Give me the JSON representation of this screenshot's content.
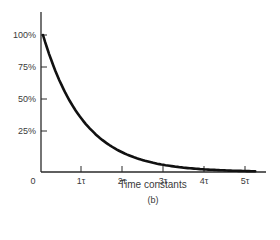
{
  "chart_data": {
    "type": "line",
    "title": "",
    "caption": "(b)",
    "xlabel": "Time constants",
    "ylabel": "",
    "x_tick_labels": [
      "0",
      "1τ",
      "2τ",
      "3τ",
      "4τ",
      "5τ"
    ],
    "y_tick_labels": [
      "25%",
      "50%",
      "75%",
      "100%"
    ],
    "xlim": [
      0,
      5.5
    ],
    "ylim": [
      0,
      100
    ],
    "grid": false,
    "legend": null,
    "series": [
      {
        "name": "Exponential decay",
        "x": [
          0,
          0.25,
          0.5,
          0.75,
          1,
          1.5,
          2,
          2.5,
          3,
          3.5,
          4,
          4.5,
          5
        ],
        "values": [
          100,
          77.9,
          60.7,
          47.2,
          36.8,
          22.3,
          13.5,
          8.2,
          5.0,
          3.0,
          1.8,
          1.1,
          0.7
        ]
      }
    ]
  },
  "labels": {
    "y": [
      {
        "text": "100%",
        "top": 30
      },
      {
        "text": "75%",
        "top": 62
      },
      {
        "text": "50%",
        "top": 94
      },
      {
        "text": "25%",
        "top": 126
      }
    ],
    "x": [
      {
        "text": "0",
        "left": 33
      },
      {
        "text": "1τ",
        "left": 81
      },
      {
        "text": "2τ",
        "left": 122
      },
      {
        "text": "3τ",
        "left": 163
      },
      {
        "text": "4τ",
        "left": 204
      },
      {
        "text": "5τ",
        "left": 245
      }
    ]
  }
}
